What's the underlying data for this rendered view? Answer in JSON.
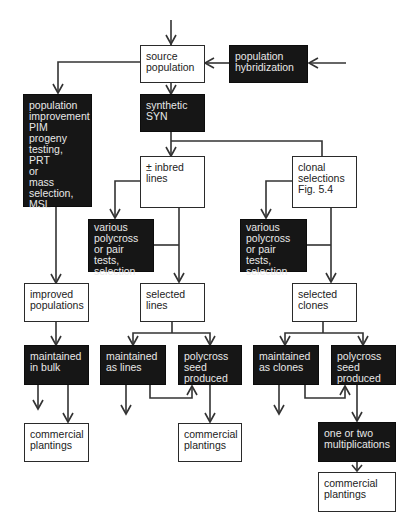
{
  "diagram": {
    "type": "flowchart",
    "title": "",
    "colors": {
      "light_box": "#ffffff",
      "dark_box": "#161616",
      "line": "#333333",
      "dark_text": "#e8e8e8",
      "light_text": "#222222"
    },
    "nodes": {
      "source_population": {
        "label": "source\npopulation",
        "style": "light"
      },
      "population_hybridization": {
        "label": "population\nhybridization",
        "style": "dark"
      },
      "population_improvement": {
        "label": "population\nimprovement\nPIM\nprogeny\ntesting, PRT\nor\nmass\nselection,\nMSL",
        "style": "dark"
      },
      "synthetic": {
        "label": "synthetic\nSYN",
        "style": "dark"
      },
      "inbred_lines": {
        "label": "± inbred\nlines",
        "style": "light"
      },
      "clonal_selections": {
        "label": "clonal\nselections\nFig. 5.4",
        "style": "light"
      },
      "various_tests_lines": {
        "label": "various\npolycross\nor pair\ntests,\nselection",
        "style": "dark"
      },
      "various_tests_clones": {
        "label": "various\npolycross\nor pair\ntests,\nselection",
        "style": "dark"
      },
      "improved_populations": {
        "label": "improved\npopulations",
        "style": "light"
      },
      "selected_lines": {
        "label": "selected\nlines",
        "style": "light"
      },
      "selected_clones": {
        "label": "selected\nclones",
        "style": "light"
      },
      "maintained_in_bulk": {
        "label": "maintained\nin bulk",
        "style": "dark"
      },
      "maintained_as_lines": {
        "label": "maintained\nas lines",
        "style": "dark"
      },
      "polycross_seed_lines": {
        "label": "polycross\nseed\nproduced",
        "style": "dark"
      },
      "maintained_as_clones": {
        "label": "maintained\nas clones",
        "style": "dark"
      },
      "polycross_seed_clones": {
        "label": "polycross\nseed\nproduced",
        "style": "dark"
      },
      "commercial_plantings_bulk": {
        "label": "commercial\nplantings",
        "style": "light"
      },
      "commercial_plantings_lines": {
        "label": "commercial\nplantings",
        "style": "light"
      },
      "multiplications": {
        "label": "one or two\nmultiplications",
        "style": "dark"
      },
      "commercial_plantings_clones": {
        "label": "commercial\nplantings",
        "style": "light"
      }
    },
    "edges": [
      [
        "external_input",
        "source_population"
      ],
      [
        "external_input",
        "population_hybridization"
      ],
      [
        "population_hybridization",
        "source_population"
      ],
      [
        "source_population",
        "population_improvement"
      ],
      [
        "source_population",
        "synthetic"
      ],
      [
        "synthetic",
        "inbred_lines"
      ],
      [
        "synthetic",
        "clonal_selections"
      ],
      [
        "inbred_lines",
        "various_tests_lines"
      ],
      [
        "inbred_lines",
        "selected_lines"
      ],
      [
        "various_tests_lines",
        "selected_lines"
      ],
      [
        "clonal_selections",
        "various_tests_clones"
      ],
      [
        "clonal_selections",
        "selected_clones"
      ],
      [
        "various_tests_clones",
        "selected_clones"
      ],
      [
        "population_improvement",
        "improved_populations"
      ],
      [
        "improved_populations",
        "maintained_in_bulk"
      ],
      [
        "maintained_in_bulk",
        "output"
      ],
      [
        "maintained_in_bulk",
        "commercial_plantings_bulk"
      ],
      [
        "selected_lines",
        "maintained_as_lines"
      ],
      [
        "selected_lines",
        "polycross_seed_lines"
      ],
      [
        "maintained_as_lines",
        "output"
      ],
      [
        "maintained_as_lines",
        "polycross_seed_lines"
      ],
      [
        "polycross_seed_lines",
        "commercial_plantings_lines"
      ],
      [
        "selected_clones",
        "maintained_as_clones"
      ],
      [
        "selected_clones",
        "polycross_seed_clones"
      ],
      [
        "maintained_as_clones",
        "output"
      ],
      [
        "maintained_as_clones",
        "polycross_seed_clones"
      ],
      [
        "polycross_seed_clones",
        "multiplications"
      ],
      [
        "multiplications",
        "commercial_plantings_clones"
      ]
    ]
  }
}
